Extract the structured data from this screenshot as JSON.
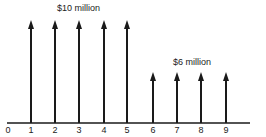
{
  "diagram": {
    "type": "cash-flow-diagram",
    "axis": {
      "x_start": 7,
      "x_end": 250,
      "y": 123,
      "color": "#1a1a1a"
    },
    "ticks": [
      "0",
      "1",
      "2",
      "3",
      "4",
      "5",
      "6",
      "7",
      "8",
      "9"
    ],
    "tick_x": [
      8,
      31,
      55,
      79,
      104,
      127,
      153,
      177,
      201,
      226
    ],
    "arrows": [
      {
        "period": 1,
        "amount_label": "$10 million",
        "top": 20
      },
      {
        "period": 2,
        "amount_label": "$10 million",
        "top": 20
      },
      {
        "period": 3,
        "amount_label": "$10 million",
        "top": 20
      },
      {
        "period": 4,
        "amount_label": "$10 million",
        "top": 20
      },
      {
        "period": 5,
        "amount_label": "$10 million",
        "top": 20
      },
      {
        "period": 6,
        "amount_label": "$6 million",
        "top": 72
      },
      {
        "period": 7,
        "amount_label": "$6 million",
        "top": 72
      },
      {
        "period": 8,
        "amount_label": "$6 million",
        "top": 72
      },
      {
        "period": 9,
        "amount_label": "$6 million",
        "top": 72
      }
    ],
    "labels": {
      "high": "$10 million",
      "low": "$6 million"
    }
  },
  "chart_data": {
    "type": "bar",
    "title": "",
    "xlabel": "",
    "ylabel": "",
    "categories": [
      "1",
      "2",
      "3",
      "4",
      "5",
      "6",
      "7",
      "8",
      "9"
    ],
    "values": [
      10,
      10,
      10,
      10,
      10,
      6,
      6,
      6,
      6
    ],
    "units": "$ million",
    "annotations": [
      "$10 million",
      "$6 million"
    ],
    "x_ticks": [
      "0",
      "1",
      "2",
      "3",
      "4",
      "5",
      "6",
      "7",
      "8",
      "9"
    ]
  }
}
